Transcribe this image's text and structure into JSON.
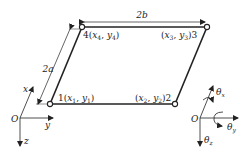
{
  "diagram": {
    "type": "parallelogram-element",
    "colors": {
      "line": "#222222",
      "background": "#ffffff"
    },
    "dimensions": {
      "top": "2b",
      "left": "2a"
    },
    "nodes": [
      {
        "id": "1",
        "label_num": "1",
        "x_var": "x",
        "x_sub": "1",
        "y_var": "y",
        "y_sub": "1"
      },
      {
        "id": "2",
        "label_num": "2",
        "x_var": "x",
        "x_sub": "2",
        "y_var": "y",
        "y_sub": "2"
      },
      {
        "id": "3",
        "label_num": "3",
        "x_var": "x",
        "x_sub": "3",
        "y_var": "y",
        "y_sub": "3"
      },
      {
        "id": "4",
        "label_num": "4",
        "x_var": "x",
        "x_sub": "4",
        "y_var": "y",
        "y_sub": "4"
      }
    ],
    "left_axes": {
      "origin": "O",
      "x": "x",
      "y": "y",
      "z": "z"
    },
    "right_axes": {
      "origin": "O",
      "theta": "θ",
      "theta_x_sub": "x",
      "theta_y_sub": "y",
      "theta_z_sub": "z"
    }
  }
}
